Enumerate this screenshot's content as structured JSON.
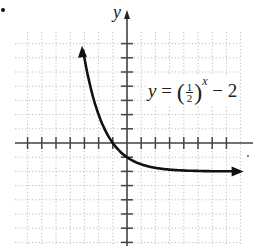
{
  "chart_data": {
    "type": "line",
    "title": "",
    "function": "y = (1/2)^x - 2",
    "xlabel": "x",
    "ylabel": "y",
    "xlim": [
      -8,
      8
    ],
    "ylim": [
      -7,
      8
    ],
    "grid": true,
    "asymptote": {
      "y": -2
    },
    "x_ticks": [
      -7,
      -6,
      -5,
      -4,
      -3,
      -2,
      -1,
      1,
      2,
      3,
      4,
      5,
      6,
      7
    ],
    "y_ticks": [
      -7,
      -6,
      -5,
      -4,
      -3,
      -2,
      -1,
      1,
      2,
      3,
      4,
      5,
      6,
      7
    ],
    "series": [
      {
        "name": "y = (1/2)^x - 2",
        "x": [
          -3.1,
          -3,
          -2.5,
          -2,
          -1.5,
          -1,
          -0.5,
          0,
          0.5,
          1,
          2,
          3,
          4,
          5,
          6,
          7,
          8
        ],
        "values": [
          6.57,
          6,
          3.66,
          2,
          0.83,
          0,
          -0.59,
          -1,
          -1.29,
          -1.5,
          -1.75,
          -1.875,
          -1.94,
          -1.97,
          -1.98,
          -1.99,
          -2.0
        ]
      }
    ],
    "annotations": [
      {
        "text": "y = (1/2)^x − 2",
        "position": "upper right of y-axis"
      }
    ]
  },
  "labels": {
    "y_axis": "y",
    "eq_y": "y",
    "eq_equals": " = ",
    "eq_num": "1",
    "eq_den": "2",
    "eq_exp": "x",
    "eq_tail": " − 2",
    "bullet": "•"
  },
  "colors": {
    "curve": "#111111",
    "axis": "#444444",
    "grid": "#bdbdbd",
    "text": "#222222"
  }
}
